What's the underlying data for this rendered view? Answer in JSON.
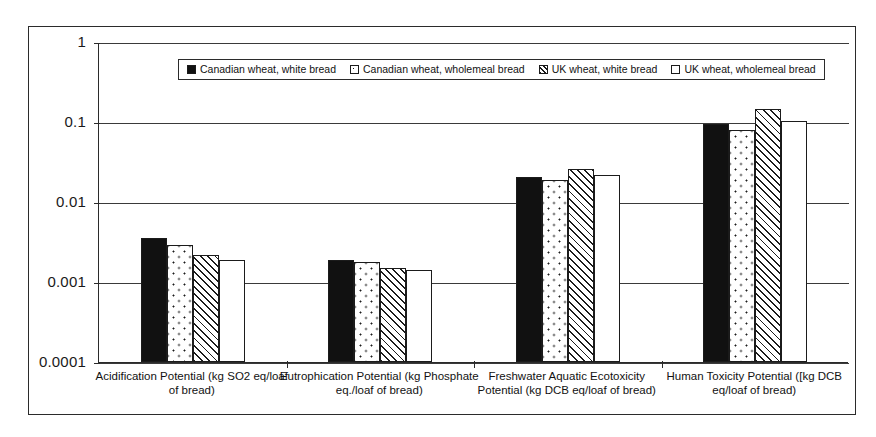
{
  "chart_data": {
    "type": "bar",
    "title": "",
    "subtitle": "",
    "xlabel": "",
    "ylabel": "",
    "yscale": "log",
    "ylim": [
      0.0001,
      1
    ],
    "ytick_labels": [
      "1",
      "0.1",
      "0.01",
      "0.001",
      "0.0001"
    ],
    "ytick_values": [
      1,
      0.1,
      0.01,
      0.001,
      0.0001
    ],
    "grid": "horizontal",
    "legend_position": "top-center",
    "categories": [
      "Acidification Potential (kg SO2 eq/loaf of bread)",
      "Eutrophication Potential (kg Phosphate eq./loaf of bread)",
      "Freshwater Aquatic Ecotoxicity Potential (kg DCB eq/loaf of bread)",
      "Human Toxicity Potential ([kg DCB eq/loaf of bread)"
    ],
    "series": [
      {
        "name": "Canadian wheat, white bread",
        "pattern": "solid-black",
        "values": [
          0.0035,
          0.0019,
          0.0205,
          0.094
        ]
      },
      {
        "name": "Canadian wheat, wholemeal bread",
        "pattern": "white-dotted",
        "values": [
          0.0029,
          0.0018,
          0.019,
          0.08
        ]
      },
      {
        "name": "UK wheat, white bread",
        "pattern": "diagonal-hatch",
        "values": [
          0.0022,
          0.0015,
          0.026,
          0.145
        ]
      },
      {
        "name": "UK wheat, wholemeal bread",
        "pattern": "plain-white",
        "values": [
          0.0019,
          0.0014,
          0.022,
          0.104
        ]
      }
    ]
  },
  "colors": {
    "axis": "#2b2b2b",
    "gridline": "#3a3a3a",
    "bar_outline": "#1b1b1b",
    "fill_solid": "#111111",
    "background": "#ffffff"
  }
}
